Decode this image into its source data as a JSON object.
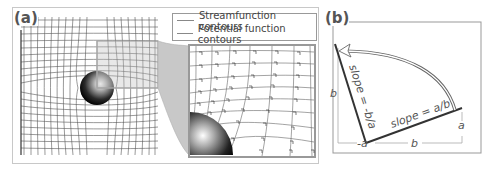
{
  "panel_a": {
    "label": "(a)",
    "legend": {
      "items": [
        {
          "label": "Streamfunction contours",
          "color": "#888888"
        },
        {
          "label": "Potential function contours",
          "color": "#888888"
        }
      ]
    }
  },
  "panel_b": {
    "label": "(b)",
    "labels": {
      "slope_left": "slope = -b/a",
      "slope_right": "slope = a/b",
      "dim_left_vertical": "b",
      "dim_right_vertical": "a",
      "dim_bottom_left": "-a",
      "dim_bottom_right": "b"
    }
  },
  "colors": {
    "grid_line": "#555555",
    "funnel_fill": "#c8c8c8",
    "inset_border": "#999999",
    "line_dark": "#333333",
    "text": "#555555"
  }
}
